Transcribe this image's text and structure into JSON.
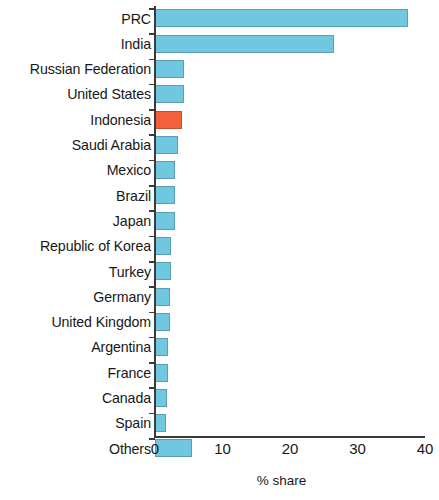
{
  "chart_data": {
    "type": "bar",
    "orientation": "horizontal",
    "title": "",
    "xlabel": "% share",
    "ylabel": "",
    "xlim": [
      0,
      40
    ],
    "xticks": [
      0,
      10,
      20,
      30,
      40
    ],
    "xticklabels": [
      "0",
      "10",
      "20",
      "30",
      "40"
    ],
    "grid": false,
    "legend": false,
    "categories": [
      "PRC",
      "India",
      "Russian Federation",
      "United States",
      "Indonesia",
      "Saudi Arabia",
      "Mexico",
      "Brazil",
      "Japan",
      "Republic of Korea",
      "Turkey",
      "Germany",
      "United Kingdom",
      "Argentina",
      "France",
      "Canada",
      "Spain",
      "Others"
    ],
    "values": [
      37.5,
      26.5,
      4.3,
      4.3,
      4.0,
      3.4,
      3.0,
      3.0,
      3.0,
      2.3,
      2.3,
      2.2,
      2.2,
      1.9,
      1.9,
      1.8,
      1.7,
      5.5
    ],
    "bar_colors": [
      "#6fc8e0",
      "#6fc8e0",
      "#6fc8e0",
      "#6fc8e0",
      "#f2613a",
      "#6fc8e0",
      "#6fc8e0",
      "#6fc8e0",
      "#6fc8e0",
      "#6fc8e0",
      "#6fc8e0",
      "#6fc8e0",
      "#6fc8e0",
      "#6fc8e0",
      "#6fc8e0",
      "#6fc8e0",
      "#6fc8e0",
      "#6fc8e0"
    ],
    "highlight_category": "Indonesia",
    "colors": {
      "bar": "#6fc8e0",
      "bar_edge": "#5d9db4",
      "highlight": "#f2613a",
      "highlight_edge": "#c04f2f",
      "axis": "#3a3a3a",
      "text": "#171717",
      "background": "#ffffff"
    }
  }
}
